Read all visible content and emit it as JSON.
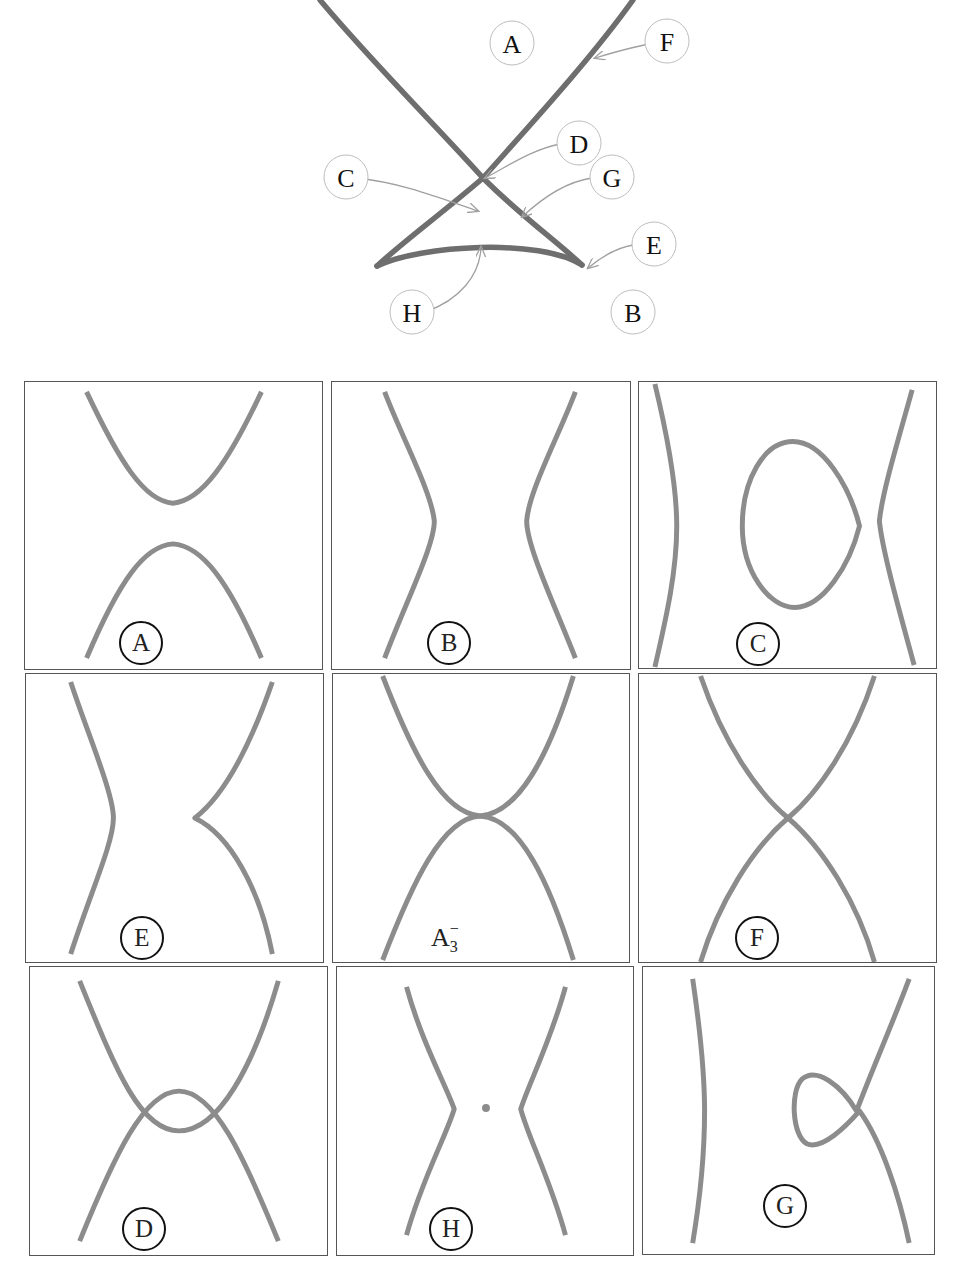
{
  "figure": {
    "top_diagram": {
      "description": "Bifurcation set: two crossing curves forming an X above a curvilinear triangle with a concave base",
      "callouts": [
        {
          "id": "A",
          "label": "A",
          "points_to": "region above the crossing"
        },
        {
          "id": "F",
          "label": "F",
          "points_to": "right branch of the X"
        },
        {
          "id": "D",
          "label": "D",
          "points_to": "crossing point"
        },
        {
          "id": "C",
          "label": "C",
          "points_to": "inside the triangle"
        },
        {
          "id": "G",
          "label": "G",
          "points_to": "right edge of the triangle"
        },
        {
          "id": "E",
          "label": "E",
          "points_to": "right cusp"
        },
        {
          "id": "H",
          "label": "H",
          "points_to": "curved base of the triangle"
        },
        {
          "id": "B",
          "label": "B",
          "points_to": "region below"
        }
      ],
      "stroke_color": "#6e6e6e",
      "arrow_color": "#a0a0a0"
    },
    "panels": [
      {
        "id": "A",
        "badge": "A",
        "row": 1,
        "col": 1,
        "shape": "two separated parabolas (one opening up, one opening down)"
      },
      {
        "id": "B",
        "badge": "B",
        "row": 1,
        "col": 2,
        "shape": "two separated curves bending inward"
      },
      {
        "id": "C",
        "badge": "C",
        "row": 1,
        "col": 3,
        "shape": "two side curves with a closed oval in the middle"
      },
      {
        "id": "E",
        "badge": "E",
        "row": 2,
        "col": 1,
        "shape": "left smooth curve, right curve with a cusp"
      },
      {
        "id": "A3",
        "badge": "A",
        "badge_sub": "3",
        "badge_sup": "−",
        "row": 2,
        "col": 2,
        "shape": "two parabolas tangent at one point"
      },
      {
        "id": "F",
        "badge": "F",
        "row": 2,
        "col": 3,
        "shape": "two curves crossing transversally"
      },
      {
        "id": "D",
        "badge": "D",
        "row": 3,
        "col": 1,
        "shape": "two parabolas crossing at two points"
      },
      {
        "id": "H",
        "badge": "H",
        "row": 3,
        "col": 2,
        "shape": "two curves with corners and an isolated point in the middle"
      },
      {
        "id": "G",
        "badge": "G",
        "row": 3,
        "col": 3,
        "shape": "left smooth curve, right curve with a loop"
      }
    ],
    "curve_color": "#8c8c8c",
    "border_color": "#555555"
  }
}
